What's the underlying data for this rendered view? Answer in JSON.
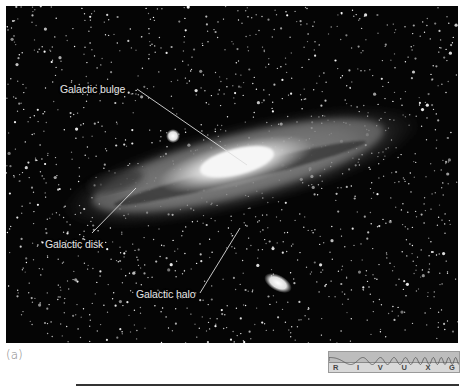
{
  "figure": {
    "panel_label": "(a)",
    "labels": [
      {
        "id": "bulge",
        "text": "Galactic bulge"
      },
      {
        "id": "disk",
        "text": "Galactic disk"
      },
      {
        "id": "halo",
        "text": "Galactic halo"
      }
    ],
    "spectrum_bands": [
      "R",
      "I",
      "V",
      "U",
      "X",
      "G"
    ],
    "highlighted_band": "V",
    "colors": {
      "sky": "#050505",
      "label_text": "#e6e6e6",
      "leader_line": "#dddddd",
      "spectrum_bg": "#d9d9d9"
    }
  }
}
